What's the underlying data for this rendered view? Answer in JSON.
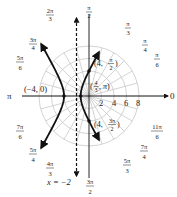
{
  "chart_data": {
    "type": "line",
    "coordinate_system": "polar",
    "title": "",
    "polar_grid": {
      "radii": [
        2,
        4,
        6,
        8
      ],
      "radial_tick_labels": [
        "2",
        "4",
        "6",
        "8"
      ],
      "angle_step": "pi/12",
      "angle_labels": [
        {
          "angle": "0",
          "text": "0"
        },
        {
          "angle": "pi/6",
          "text": "π/6"
        },
        {
          "angle": "pi/4",
          "text": "π/4"
        },
        {
          "angle": "pi/3",
          "text": "π/3"
        },
        {
          "angle": "pi/2",
          "text": "π/2"
        },
        {
          "angle": "2pi/3",
          "text": "2π/3"
        },
        {
          "angle": "3pi/4",
          "text": "3π/4"
        },
        {
          "angle": "5pi/6",
          "text": "5π/6"
        },
        {
          "angle": "pi",
          "text": "π"
        },
        {
          "angle": "7pi/6",
          "text": "7π/6"
        },
        {
          "angle": "5pi/4",
          "text": "5π/4"
        },
        {
          "angle": "4pi/3",
          "text": "4π/3"
        },
        {
          "angle": "3pi/2",
          "text": "3π/2"
        },
        {
          "angle": "5pi/3",
          "text": "5π/3"
        },
        {
          "angle": "7pi/4",
          "text": "7π/4"
        },
        {
          "angle": "11pi/6",
          "text": "11π/6"
        }
      ]
    },
    "series": [
      {
        "name": "hyperbola",
        "equation": "r = 4 / (1 - 2cosθ)",
        "branches": [
          "left branch through (-4, 0)",
          "right branch through (4/3, π), (4, π/2), (4, 3π/2)"
        ]
      },
      {
        "name": "directrix",
        "equation": "x = -2",
        "style": "dashed"
      }
    ],
    "points": [
      {
        "label": "(−4, 0)",
        "r": -4,
        "theta": "0"
      },
      {
        "label": "(4/3, π)",
        "r": 1.3333,
        "theta": "pi"
      },
      {
        "label": "(4, π/2)",
        "r": 4,
        "theta": "pi/2"
      },
      {
        "label": "(4, 3π/2)",
        "r": 4,
        "theta": "3pi/2"
      }
    ],
    "annotations": [
      "x = −2"
    ]
  },
  "labels": {
    "axis_zero": "0",
    "axis_pi": "π",
    "point_left_vertex": "(−4, 0)",
    "directrix": "x = −2",
    "r2": "2",
    "r4": "4",
    "r6": "6",
    "r8": "8"
  }
}
